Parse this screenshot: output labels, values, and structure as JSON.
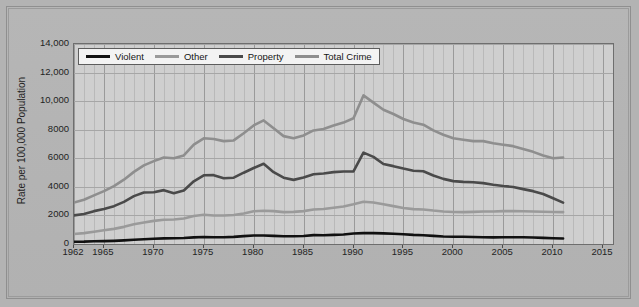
{
  "chart_data": {
    "type": "line",
    "title": "",
    "xlabel": "",
    "ylabel": "Rate per 100,000 Population",
    "xlim": [
      1962,
      2016
    ],
    "ylim": [
      0,
      14000
    ],
    "grid": true,
    "legend_position": "top-left",
    "y_ticks": [
      "0",
      "2000",
      "4000",
      "6000",
      "8000",
      "10,000",
      "12,000",
      "14,000"
    ],
    "y_tick_values": [
      0,
      2000,
      4000,
      6000,
      8000,
      10000,
      12000,
      14000
    ],
    "x_ticks": [
      "1962",
      "1965",
      "1970",
      "1975",
      "1980",
      "1985",
      "1990",
      "1995",
      "2000",
      "2005",
      "2010",
      "2015"
    ],
    "x_tick_values": [
      1962,
      1965,
      1970,
      1975,
      1980,
      1985,
      1990,
      1995,
      2000,
      2005,
      2010,
      2015
    ],
    "x": [
      1962,
      1963,
      1964,
      1965,
      1966,
      1967,
      1968,
      1969,
      1970,
      1971,
      1972,
      1973,
      1974,
      1975,
      1976,
      1977,
      1978,
      1979,
      1980,
      1981,
      1982,
      1983,
      1984,
      1985,
      1986,
      1987,
      1988,
      1989,
      1990,
      1991,
      1992,
      1993,
      1994,
      1995,
      1996,
      1997,
      1998,
      1999,
      2000,
      2001,
      2002,
      2003,
      2004,
      2005,
      2006,
      2007,
      2008,
      2009,
      2010,
      2011
    ],
    "series": [
      {
        "name": "Violent",
        "color": "#111111",
        "values": [
          162,
          168,
          191,
          200,
          220,
          254,
          298,
          329,
          364,
          396,
          401,
          417,
          461,
          487,
          468,
          476,
          498,
          549,
          597,
          594,
          571,
          538,
          539,
          558,
          618,
          610,
          640,
          666,
          730,
          758,
          758,
          747,
          714,
          685,
          637,
          611,
          568,
          523,
          507,
          505,
          494,
          476,
          464,
          469,
          474,
          472,
          458,
          432,
          405,
          387
        ]
      },
      {
        "name": "Other",
        "color": "#9a9a9a",
        "values": [
          700,
          760,
          860,
          960,
          1060,
          1200,
          1380,
          1500,
          1620,
          1700,
          1720,
          1780,
          1960,
          2050,
          2000,
          1990,
          2030,
          2130,
          2290,
          2330,
          2300,
          2230,
          2250,
          2300,
          2420,
          2450,
          2540,
          2620,
          2780,
          2960,
          2900,
          2780,
          2650,
          2520,
          2440,
          2420,
          2340,
          2280,
          2240,
          2230,
          2250,
          2280,
          2280,
          2300,
          2300,
          2290,
          2280,
          2260,
          2240,
          2230
        ]
      },
      {
        "name": "Property",
        "color": "#4a4a4a",
        "values": [
          2000,
          2100,
          2300,
          2450,
          2650,
          2950,
          3350,
          3600,
          3620,
          3770,
          3560,
          3740,
          4390,
          4810,
          4820,
          4600,
          4640,
          4990,
          5320,
          5620,
          5030,
          4640,
          4490,
          4650,
          4880,
          4940,
          5030,
          5080,
          5080,
          6400,
          6100,
          5600,
          5450,
          5280,
          5130,
          5090,
          4800,
          4560,
          4400,
          4350,
          4320,
          4260,
          4150,
          4060,
          3990,
          3840,
          3700,
          3500,
          3200,
          2900
        ]
      },
      {
        "name": "Total Crime",
        "color": "#8e8e8e",
        "values": [
          2900,
          3100,
          3400,
          3700,
          4050,
          4500,
          5050,
          5500,
          5800,
          6050,
          6000,
          6200,
          6950,
          7400,
          7350,
          7200,
          7250,
          7750,
          8300,
          8650,
          8100,
          7550,
          7400,
          7600,
          7950,
          8050,
          8300,
          8500,
          8800,
          10400,
          9900,
          9400,
          9100,
          8750,
          8500,
          8350,
          7950,
          7650,
          7400,
          7300,
          7200,
          7200,
          7050,
          6950,
          6850,
          6650,
          6450,
          6200,
          6000,
          6050
        ]
      }
    ]
  },
  "legend": {
    "items": [
      {
        "label": "Violent",
        "color": "#111111"
      },
      {
        "label": "Other",
        "color": "#9a9a9a"
      },
      {
        "label": "Property",
        "color": "#4a4a4a"
      },
      {
        "label": "Total Crime",
        "color": "#8e8e8e"
      }
    ]
  }
}
